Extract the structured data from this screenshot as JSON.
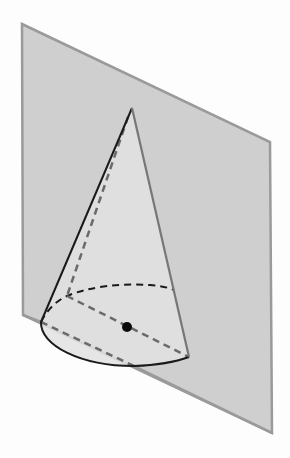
{
  "figure": {
    "colors": {
      "background": "#fdfdfd",
      "plane_fill": "#cfcfcf",
      "plane_edge": "#9a9a9a",
      "cone_fill": "#e2e2e2",
      "cone_edge_dark": "#1a1a1a",
      "cone_edge_gray": "#777777",
      "dashed_dark": "#1a1a1a",
      "dashed_gray": "#6a6a6a",
      "center_dot": "#0a0a0a"
    },
    "plane": {
      "top_left": [
        22,
        24
      ],
      "top_right": [
        270,
        142
      ],
      "bottom_right": [
        272,
        433
      ],
      "bottom_left": [
        23,
        315
      ]
    },
    "cone": {
      "apex": [
        132,
        108
      ],
      "base_left": [
        41,
        322
      ],
      "base_right": [
        189,
        357
      ],
      "base_bottom": [
        134,
        366
      ],
      "base_back": [
        67,
        296
      ],
      "base_center": [
        127,
        327
      ]
    },
    "center_dot_radius": 5
  }
}
